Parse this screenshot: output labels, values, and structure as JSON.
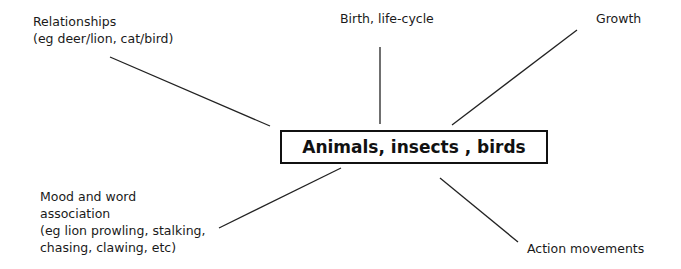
{
  "diagram": {
    "type": "mind-map",
    "center": {
      "label": "Animals, insects , birds"
    },
    "branches": [
      {
        "id": "relationships",
        "lines": [
          "Relationships",
          "(eg deer/lion, cat/bird)"
        ]
      },
      {
        "id": "birth",
        "lines": [
          "Birth, life-cycle"
        ]
      },
      {
        "id": "growth",
        "lines": [
          "Growth"
        ]
      },
      {
        "id": "mood",
        "lines": [
          "Mood and word",
          "association",
          "(eg lion prowling, stalking,",
          "chasing, clawing, etc)"
        ]
      },
      {
        "id": "action",
        "lines": [
          "Action movements"
        ]
      }
    ],
    "colors": {
      "line": "#222222",
      "text": "#1a1a1a",
      "background": "#ffffff"
    }
  }
}
